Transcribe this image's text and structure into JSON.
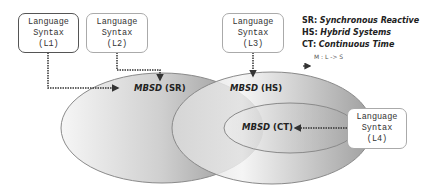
{
  "diagram": {
    "language_boxes": [
      {
        "id": "L1",
        "line1": "Language",
        "line2": "Syntax",
        "line3": "(L1)"
      },
      {
        "id": "L2",
        "line1": "Language",
        "line2": "Syntax",
        "line3": "(L2)"
      },
      {
        "id": "L3",
        "line1": "Language",
        "line2": "Syntax",
        "line3": "(L3)"
      },
      {
        "id": "L4",
        "line1": "Language",
        "line2": "Syntax",
        "line3": "(L4)"
      }
    ],
    "semantic_domains": [
      {
        "id": "SR",
        "prefix": "MBSD",
        "suffix": "(SR)"
      },
      {
        "id": "HS",
        "prefix": "MBSD",
        "suffix": "(HS)"
      },
      {
        "id": "CT",
        "prefix": "MBSD",
        "suffix": "(CT)"
      }
    ],
    "legend": {
      "items": [
        {
          "key": "SR:",
          "value": "Synchronous Reactive"
        },
        {
          "key": "HS:",
          "value": "Hybrid Systems"
        },
        {
          "key": "CT:",
          "value": "Continuous Time"
        }
      ],
      "mapping": "M : L -> S"
    },
    "edges": [
      {
        "from": "L1",
        "to": "SR"
      },
      {
        "from": "L2",
        "to": "SR"
      },
      {
        "from": "L3",
        "to": "HS"
      },
      {
        "from": "L4",
        "to": "CT"
      }
    ],
    "colors": {
      "ellipse_light": "#f4f4f4",
      "ellipse_dark": "#9a9a9a",
      "ellipse_stroke": "#8a8a8a",
      "arrow": "#333333"
    }
  }
}
